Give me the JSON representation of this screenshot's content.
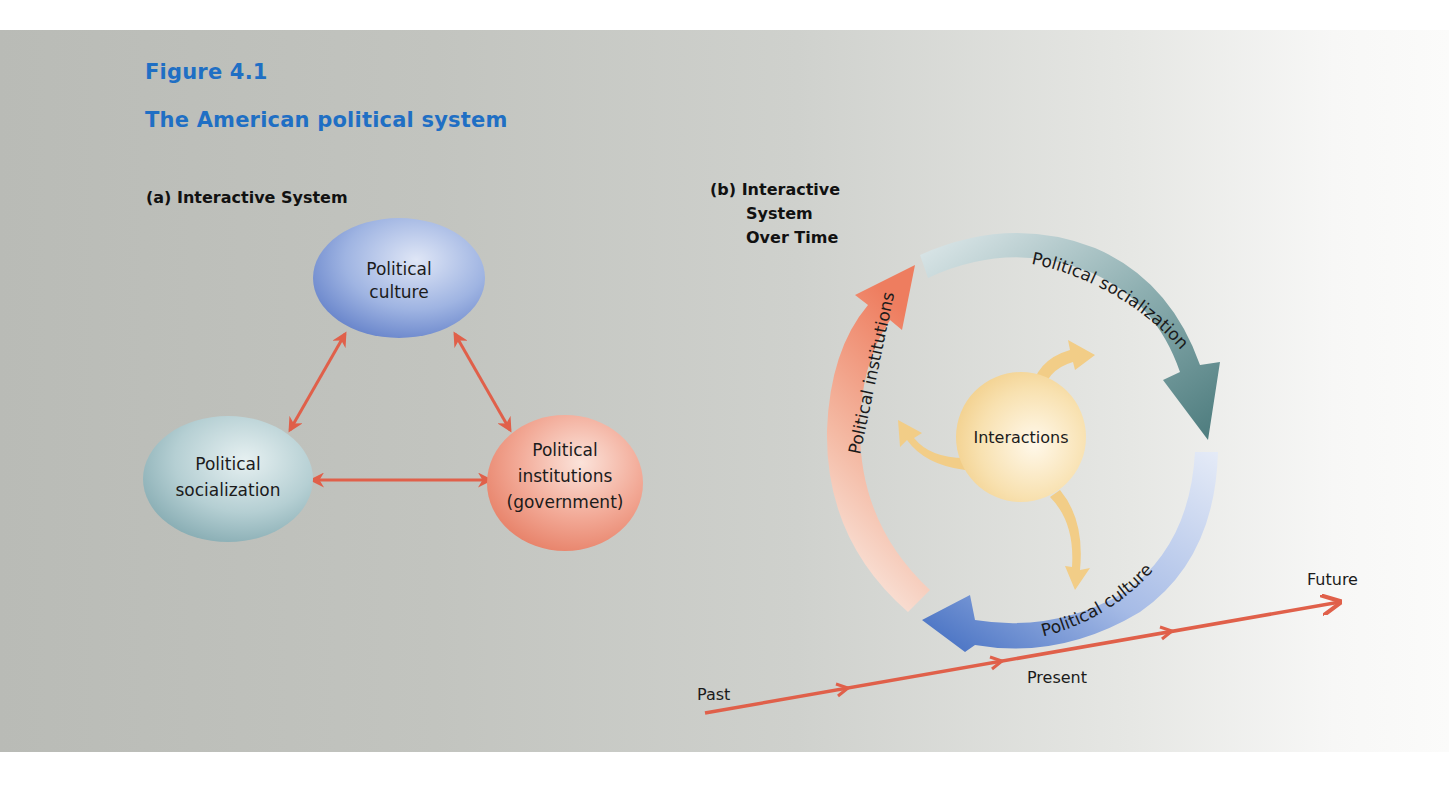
{
  "figure": {
    "label": "Figure 4.1",
    "title": "The American political system"
  },
  "part_a": {
    "title": "(a) Interactive System",
    "nodes": [
      {
        "id": "culture",
        "lines": [
          "Political",
          "culture"
        ],
        "color": "#7f9ad6"
      },
      {
        "id": "socialization",
        "lines": [
          "Political",
          "socialization"
        ],
        "color": "#a9c7cc"
      },
      {
        "id": "institutions",
        "lines": [
          "Political",
          "institutions",
          "(government)"
        ],
        "color": "#ee9a86"
      }
    ],
    "edges": [
      {
        "from": "culture",
        "to": "socialization",
        "type": "bidirectional"
      },
      {
        "from": "culture",
        "to": "institutions",
        "type": "bidirectional"
      },
      {
        "from": "socialization",
        "to": "institutions",
        "type": "bidirectional"
      }
    ],
    "arrow_color": "#e0604a"
  },
  "part_b": {
    "title_lines": [
      "(b) Interactive",
      "System",
      "Over Time"
    ],
    "center": {
      "label": "Interactions",
      "color": "#f5d89a"
    },
    "cycle_arrows": [
      {
        "label": "Political socialization",
        "color": "#4f7f80"
      },
      {
        "label": "Political culture",
        "color": "#4a76c4"
      },
      {
        "label": "Political institutions",
        "color": "#ef8466"
      }
    ],
    "timeline": {
      "labels": {
        "past": "Past",
        "present": "Present",
        "future": "Future"
      },
      "color": "#e0604a"
    }
  }
}
